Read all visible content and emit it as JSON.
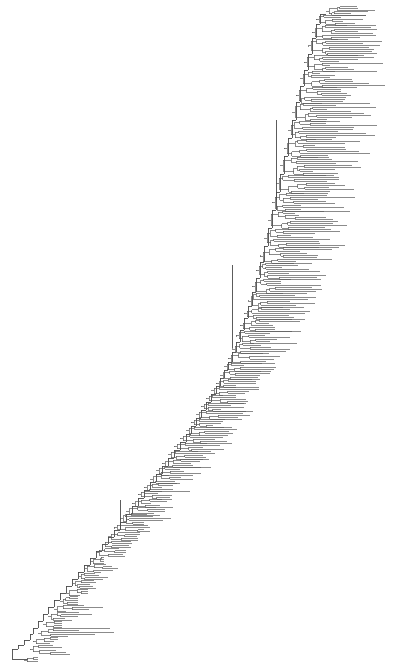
{
  "figure": {
    "type": "phylogenetic-tree",
    "style": "rectangular-cladogram",
    "title": "",
    "background_color": "#ffffff",
    "branch_color": "#5a5a5a",
    "branch_width": 0.7,
    "width": 402,
    "height": 665,
    "orientation": "left-to-right",
    "ladderized": true,
    "tip_labels_visible": false,
    "scale_bar_visible": false,
    "axis_visible": false,
    "legend_visible": false,
    "root_position": {
      "x": 18,
      "y": 649
    },
    "tip_count": 281
  },
  "chart_data": {
    "type": "tree",
    "title": "",
    "xlabel": "",
    "ylabel": "",
    "grid": false,
    "legend_position": "none",
    "xlim": [
      0,
      402
    ],
    "ylim": [
      0,
      665
    ],
    "tip_count": 281,
    "layout": {
      "root_x": 18,
      "tip_y_min": 8,
      "tip_y_max": 660,
      "tip_spacing": 2.33,
      "max_tip_x": 389
    },
    "seed": 20240517,
    "trunk": {
      "comment": "Backbone spine node positions (x,y) ordered root->crown; each successive node nests the remaining clade.",
      "nodes": [
        [
          18,
          649
        ],
        [
          24,
          645
        ],
        [
          30,
          640
        ],
        [
          33,
          634
        ],
        [
          38,
          628
        ],
        [
          43,
          621
        ],
        [
          48,
          614
        ],
        [
          54,
          607
        ],
        [
          60,
          600
        ],
        [
          66,
          593
        ],
        [
          72,
          586
        ],
        [
          78,
          579
        ],
        [
          84,
          572
        ],
        [
          90,
          565
        ],
        [
          96,
          558
        ],
        [
          102,
          551
        ],
        [
          108,
          544
        ],
        [
          114,
          537
        ],
        [
          120,
          530
        ],
        [
          126,
          522
        ],
        [
          132,
          514
        ],
        [
          138,
          506
        ],
        [
          144,
          498
        ],
        [
          150,
          490
        ],
        [
          156,
          482
        ],
        [
          162,
          474
        ],
        [
          168,
          466
        ],
        [
          174,
          458
        ],
        [
          180,
          450
        ],
        [
          186,
          442
        ],
        [
          191,
          434
        ],
        [
          196,
          426
        ],
        [
          201,
          418
        ],
        [
          206,
          410
        ],
        [
          211,
          402
        ],
        [
          216,
          394
        ],
        [
          220,
          386
        ],
        [
          224,
          378
        ],
        [
          228,
          370
        ],
        [
          232,
          362
        ],
        [
          236,
          352
        ],
        [
          240,
          342
        ],
        [
          244,
          330
        ],
        [
          248,
          318
        ],
        [
          252,
          306
        ],
        [
          256,
          292
        ],
        [
          260,
          278
        ],
        [
          264,
          262
        ],
        [
          268,
          246
        ],
        [
          272,
          228
        ],
        [
          276,
          210
        ],
        [
          280,
          192
        ],
        [
          284,
          174
        ],
        [
          288,
          156
        ],
        [
          292,
          138
        ],
        [
          296,
          120
        ],
        [
          300,
          102
        ],
        [
          304,
          86
        ],
        [
          308,
          70
        ],
        [
          312,
          54
        ],
        [
          316,
          38
        ],
        [
          320,
          24
        ],
        [
          326,
          14
        ]
      ]
    },
    "clades": [
      {
        "id": "C1",
        "base_x": 24,
        "y_top": 656,
        "y_bot": 663,
        "tips": 3,
        "depth": 2,
        "max_ext": 38
      },
      {
        "id": "C2",
        "base_x": 30,
        "y_top": 644,
        "y_bot": 656,
        "tips": 5,
        "depth": 3,
        "max_ext": 70
      },
      {
        "id": "C3",
        "base_x": 33,
        "y_top": 636,
        "y_bot": 645,
        "tips": 4,
        "depth": 3,
        "max_ext": 58
      },
      {
        "id": "C4",
        "base_x": 38,
        "y_top": 628,
        "y_bot": 637,
        "tips": 5,
        "depth": 3,
        "max_ext": 120
      },
      {
        "id": "C5",
        "base_x": 43,
        "y_top": 620,
        "y_bot": 629,
        "tips": 4,
        "depth": 3,
        "max_ext": 62
      },
      {
        "id": "C6",
        "base_x": 48,
        "y_top": 612,
        "y_bot": 621,
        "tips": 5,
        "depth": 3,
        "max_ext": 95
      },
      {
        "id": "C7",
        "base_x": 54,
        "y_top": 604,
        "y_bot": 613,
        "tips": 4,
        "depth": 3,
        "max_ext": 105
      },
      {
        "id": "C8",
        "base_x": 60,
        "y_top": 596,
        "y_bot": 605,
        "tips": 5,
        "depth": 3,
        "max_ext": 78
      },
      {
        "id": "C9",
        "base_x": 66,
        "y_top": 588,
        "y_bot": 597,
        "tips": 4,
        "depth": 3,
        "max_ext": 88
      },
      {
        "id": "C10",
        "base_x": 72,
        "y_top": 580,
        "y_bot": 589,
        "tips": 5,
        "depth": 3,
        "max_ext": 96
      },
      {
        "id": "C11",
        "base_x": 78,
        "y_top": 572,
        "y_bot": 581,
        "tips": 4,
        "depth": 3,
        "max_ext": 110
      },
      {
        "id": "C12",
        "base_x": 84,
        "y_top": 564,
        "y_bot": 573,
        "tips": 5,
        "depth": 3,
        "max_ext": 118
      },
      {
        "id": "C13",
        "base_x": 90,
        "y_top": 556,
        "y_bot": 565,
        "tips": 4,
        "depth": 3,
        "max_ext": 104
      },
      {
        "id": "C14",
        "base_x": 96,
        "y_top": 548,
        "y_bot": 557,
        "tips": 5,
        "depth": 3,
        "max_ext": 126
      },
      {
        "id": "C15",
        "base_x": 102,
        "y_top": 540,
        "y_bot": 549,
        "tips": 4,
        "depth": 3,
        "max_ext": 135
      },
      {
        "id": "C16",
        "base_x": 108,
        "y_top": 532,
        "y_bot": 541,
        "tips": 5,
        "depth": 3,
        "max_ext": 142
      },
      {
        "id": "C17",
        "base_x": 114,
        "y_top": 524,
        "y_bot": 533,
        "tips": 4,
        "depth": 3,
        "max_ext": 150
      },
      {
        "id": "C18",
        "base_x": 120,
        "y_top": 514,
        "y_bot": 525,
        "tips": 6,
        "depth": 4,
        "max_ext": 175
      },
      {
        "id": "C19",
        "base_x": 126,
        "y_top": 506,
        "y_bot": 516,
        "tips": 5,
        "depth": 3,
        "max_ext": 165
      },
      {
        "id": "C20",
        "base_x": 132,
        "y_top": 498,
        "y_bot": 508,
        "tips": 5,
        "depth": 3,
        "max_ext": 180
      },
      {
        "id": "C21",
        "base_x": 138,
        "y_top": 490,
        "y_bot": 500,
        "tips": 5,
        "depth": 3,
        "max_ext": 172
      },
      {
        "id": "C22",
        "base_x": 144,
        "y_top": 482,
        "y_bot": 492,
        "tips": 5,
        "depth": 3,
        "max_ext": 190
      },
      {
        "id": "C23",
        "base_x": 150,
        "y_top": 474,
        "y_bot": 484,
        "tips": 5,
        "depth": 3,
        "max_ext": 196
      },
      {
        "id": "C24",
        "base_x": 156,
        "y_top": 466,
        "y_bot": 476,
        "tips": 5,
        "depth": 3,
        "max_ext": 205
      },
      {
        "id": "C25",
        "base_x": 162,
        "y_top": 458,
        "y_bot": 468,
        "tips": 5,
        "depth": 3,
        "max_ext": 212
      },
      {
        "id": "C26",
        "base_x": 168,
        "y_top": 450,
        "y_bot": 460,
        "tips": 5,
        "depth": 3,
        "max_ext": 218
      },
      {
        "id": "C27",
        "base_x": 174,
        "y_top": 442,
        "y_bot": 452,
        "tips": 5,
        "depth": 3,
        "max_ext": 224
      },
      {
        "id": "C28",
        "base_x": 180,
        "y_top": 434,
        "y_bot": 444,
        "tips": 5,
        "depth": 3,
        "max_ext": 232
      },
      {
        "id": "C29",
        "base_x": 186,
        "y_top": 426,
        "y_bot": 436,
        "tips": 5,
        "depth": 3,
        "max_ext": 238
      },
      {
        "id": "C30",
        "base_x": 191,
        "y_top": 418,
        "y_bot": 428,
        "tips": 5,
        "depth": 3,
        "max_ext": 244
      },
      {
        "id": "C31",
        "base_x": 196,
        "y_top": 410,
        "y_bot": 420,
        "tips": 5,
        "depth": 3,
        "max_ext": 250
      },
      {
        "id": "C32",
        "base_x": 201,
        "y_top": 402,
        "y_bot": 412,
        "tips": 5,
        "depth": 3,
        "max_ext": 254
      },
      {
        "id": "C33",
        "base_x": 206,
        "y_top": 394,
        "y_bot": 404,
        "tips": 5,
        "depth": 3,
        "max_ext": 258
      },
      {
        "id": "C34",
        "base_x": 211,
        "y_top": 386,
        "y_bot": 396,
        "tips": 5,
        "depth": 3,
        "max_ext": 262
      },
      {
        "id": "C35",
        "base_x": 216,
        "y_top": 378,
        "y_bot": 388,
        "tips": 5,
        "depth": 3,
        "max_ext": 268
      },
      {
        "id": "C36",
        "base_x": 220,
        "y_top": 370,
        "y_bot": 380,
        "tips": 5,
        "depth": 3,
        "max_ext": 272
      },
      {
        "id": "C37",
        "base_x": 224,
        "y_top": 362,
        "y_bot": 372,
        "tips": 5,
        "depth": 3,
        "max_ext": 276
      },
      {
        "id": "C38",
        "base_x": 228,
        "y_top": 352,
        "y_bot": 364,
        "tips": 6,
        "depth": 3,
        "max_ext": 280
      },
      {
        "id": "C39",
        "base_x": 232,
        "y_top": 342,
        "y_bot": 354,
        "tips": 6,
        "depth": 3,
        "max_ext": 290
      },
      {
        "id": "C40",
        "base_x": 236,
        "y_top": 330,
        "y_bot": 344,
        "tips": 7,
        "depth": 4,
        "max_ext": 300
      },
      {
        "id": "C41",
        "base_x": 240,
        "y_top": 318,
        "y_bot": 332,
        "tips": 7,
        "depth": 4,
        "max_ext": 306
      },
      {
        "id": "C42",
        "base_x": 244,
        "y_top": 306,
        "y_bot": 320,
        "tips": 7,
        "depth": 4,
        "max_ext": 312
      },
      {
        "id": "C43",
        "base_x": 248,
        "y_top": 292,
        "y_bot": 308,
        "tips": 8,
        "depth": 4,
        "max_ext": 318
      },
      {
        "id": "C44",
        "base_x": 252,
        "y_top": 278,
        "y_bot": 294,
        "tips": 8,
        "depth": 4,
        "max_ext": 326
      },
      {
        "id": "C45",
        "base_x": 256,
        "y_top": 262,
        "y_bot": 280,
        "tips": 9,
        "depth": 4,
        "max_ext": 334
      },
      {
        "id": "C46",
        "base_x": 260,
        "y_top": 246,
        "y_bot": 264,
        "tips": 9,
        "depth": 4,
        "max_ext": 340
      },
      {
        "id": "C47",
        "base_x": 264,
        "y_top": 228,
        "y_bot": 248,
        "tips": 10,
        "depth": 5,
        "max_ext": 348
      },
      {
        "id": "C48",
        "base_x": 268,
        "y_top": 210,
        "y_bot": 230,
        "tips": 10,
        "depth": 5,
        "max_ext": 356
      },
      {
        "id": "C49",
        "base_x": 272,
        "y_top": 192,
        "y_bot": 212,
        "tips": 10,
        "depth": 5,
        "max_ext": 362
      },
      {
        "id": "C50",
        "base_x": 276,
        "y_top": 174,
        "y_bot": 194,
        "tips": 10,
        "depth": 5,
        "max_ext": 368
      },
      {
        "id": "C51",
        "base_x": 280,
        "y_top": 156,
        "y_bot": 176,
        "tips": 10,
        "depth": 5,
        "max_ext": 372
      },
      {
        "id": "C52",
        "base_x": 284,
        "y_top": 138,
        "y_bot": 158,
        "tips": 10,
        "depth": 5,
        "max_ext": 376
      },
      {
        "id": "C53",
        "base_x": 288,
        "y_top": 120,
        "y_bot": 140,
        "tips": 10,
        "depth": 5,
        "max_ext": 380
      },
      {
        "id": "C54",
        "base_x": 292,
        "y_top": 102,
        "y_bot": 122,
        "tips": 10,
        "depth": 5,
        "max_ext": 384
      },
      {
        "id": "C55",
        "base_x": 296,
        "y_top": 86,
        "y_bot": 104,
        "tips": 9,
        "depth": 5,
        "max_ext": 386
      },
      {
        "id": "C56",
        "base_x": 300,
        "y_top": 70,
        "y_bot": 88,
        "tips": 9,
        "depth": 5,
        "max_ext": 388
      },
      {
        "id": "C57",
        "base_x": 304,
        "y_top": 54,
        "y_bot": 72,
        "tips": 9,
        "depth": 5,
        "max_ext": 386
      },
      {
        "id": "C58",
        "base_x": 308,
        "y_top": 38,
        "y_bot": 56,
        "tips": 9,
        "depth": 5,
        "max_ext": 384
      },
      {
        "id": "C59",
        "base_x": 312,
        "y_top": 24,
        "y_bot": 40,
        "tips": 8,
        "depth": 4,
        "max_ext": 382
      },
      {
        "id": "C60",
        "base_x": 316,
        "y_top": 14,
        "y_bot": 26,
        "tips": 6,
        "depth": 4,
        "max_ext": 380
      },
      {
        "id": "C61",
        "base_x": 326,
        "y_top": 6,
        "y_bot": 16,
        "tips": 6,
        "depth": 4,
        "max_ext": 378
      }
    ],
    "deep_splits": [
      {
        "comment": "Long internal backbone edges visible as tall vertical connectors",
        "x": 232,
        "y1": 265,
        "y2": 348
      },
      {
        "comment": "Deep split connecting mid-crown",
        "x": 276,
        "y1": 120,
        "y2": 200
      },
      {
        "comment": "Basal long edge",
        "x": 120,
        "y1": 500,
        "y2": 530
      }
    ]
  }
}
